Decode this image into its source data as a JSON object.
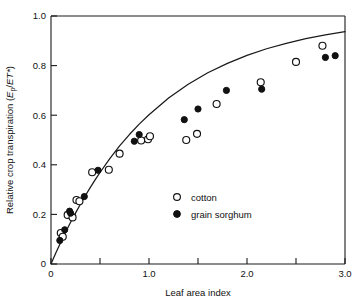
{
  "figure": {
    "title": "",
    "background_color": "#ffffff",
    "ink_color": "#111111"
  },
  "axes": {
    "x": {
      "label": "Leaf area index",
      "min": 0,
      "max": 3.0,
      "major_ticks": [
        0,
        1.0,
        2.0,
        3.0
      ],
      "major_tick_labels": [
        "0",
        "1.0",
        "2.0",
        "3.0"
      ],
      "minor_ticks": [
        0.5,
        1.5,
        2.5
      ]
    },
    "y": {
      "label_prefix": "Relative crop transpiration (",
      "label_italic_e": "E",
      "label_subscript": "p",
      "label_mid": "/",
      "label_italic_et": "ET*",
      "label_suffix": ")",
      "label_plain": "Relative crop transpiration (Ep/ET*)",
      "min": 0,
      "max": 1.0,
      "major_ticks": [
        0,
        0.2,
        0.4,
        0.6,
        0.8,
        1.0
      ],
      "major_tick_labels": [
        "0",
        "0.2",
        "0.4",
        "0.6",
        "0.8",
        "1.0"
      ]
    }
  },
  "legend": {
    "position": "inside-center-lower",
    "entries": [
      {
        "label": "cotton",
        "marker": "open-circle",
        "marker_name": "legend-marker-cotton"
      },
      {
        "label": "grain sorghum",
        "marker": "filled-circle",
        "marker_name": "legend-marker-grain-sorghum"
      }
    ]
  },
  "chart_data": {
    "type": "scatter",
    "title": "",
    "xlabel": "Leaf area index",
    "ylabel": "Relative crop transpiration (Ep/ET*)",
    "xlim": [
      0,
      3.0
    ],
    "ylim": [
      0,
      1.0
    ],
    "grid": false,
    "legend_position": "inside-center-lower",
    "series": [
      {
        "name": "cotton",
        "marker": "open-circle",
        "color": "#111111",
        "points": [
          [
            0.1,
            0.125
          ],
          [
            0.12,
            0.11
          ],
          [
            0.17,
            0.198
          ],
          [
            0.22,
            0.188
          ],
          [
            0.26,
            0.258
          ],
          [
            0.29,
            0.253
          ],
          [
            0.42,
            0.37
          ],
          [
            0.59,
            0.38
          ],
          [
            0.7,
            0.445
          ],
          [
            0.92,
            0.498
          ],
          [
            0.99,
            0.503
          ],
          [
            1.01,
            0.515
          ],
          [
            1.38,
            0.5
          ],
          [
            1.49,
            0.525
          ],
          [
            1.69,
            0.645
          ],
          [
            2.14,
            0.733
          ],
          [
            2.5,
            0.815
          ],
          [
            2.77,
            0.88
          ]
        ]
      },
      {
        "name": "grain sorghum",
        "marker": "filled-circle",
        "color": "#111111",
        "points": [
          [
            0.09,
            0.095
          ],
          [
            0.14,
            0.138
          ],
          [
            0.19,
            0.213
          ],
          [
            0.2,
            0.205
          ],
          [
            0.34,
            0.272
          ],
          [
            0.48,
            0.378
          ],
          [
            0.85,
            0.495
          ],
          [
            0.9,
            0.522
          ],
          [
            1.36,
            0.582
          ],
          [
            1.5,
            0.625
          ],
          [
            1.79,
            0.7
          ],
          [
            2.15,
            0.705
          ],
          [
            2.8,
            0.833
          ],
          [
            2.9,
            0.84
          ]
        ]
      }
    ],
    "fit_curve": {
      "name": "fitted exponential saturation curve",
      "equation": "y = 1 - exp(-k * LAI)",
      "k": 0.92,
      "x_range": [
        0.0,
        3.0
      ],
      "points": [
        [
          0.0,
          0.0
        ],
        [
          0.05,
          0.045
        ],
        [
          0.1,
          0.088
        ],
        [
          0.15,
          0.129
        ],
        [
          0.2,
          0.168
        ],
        [
          0.25,
          0.205
        ],
        [
          0.3,
          0.241
        ],
        [
          0.35,
          0.275
        ],
        [
          0.4,
          0.308
        ],
        [
          0.45,
          0.339
        ],
        [
          0.5,
          0.369
        ],
        [
          0.6,
          0.425
        ],
        [
          0.7,
          0.476
        ],
        [
          0.8,
          0.522
        ],
        [
          0.9,
          0.564
        ],
        [
          1.0,
          0.602
        ],
        [
          1.2,
          0.669
        ],
        [
          1.4,
          0.725
        ],
        [
          1.6,
          0.771
        ],
        [
          1.8,
          0.809
        ],
        [
          2.0,
          0.841
        ],
        [
          2.2,
          0.868
        ],
        [
          2.4,
          0.89
        ],
        [
          2.6,
          0.909
        ],
        [
          2.8,
          0.924
        ],
        [
          3.0,
          0.937
        ]
      ]
    }
  }
}
